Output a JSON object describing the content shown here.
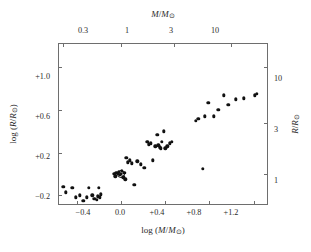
{
  "figure": {
    "kind": "scatter-plot"
  },
  "axes": {
    "bottom": {
      "title_prefix": "log (",
      "title_m": "M",
      "title_slash": "/",
      "title_m2": "M",
      "title_sun": "⊙",
      "title_suffix": ")",
      "ticks": [
        "−0.4",
        "0.0",
        "+0.4",
        "+0.8",
        "+1.2"
      ],
      "tick_values": [
        -0.4,
        0.0,
        0.4,
        0.8,
        1.2
      ]
    },
    "top": {
      "title_m": "M",
      "title_slash": "/",
      "title_m2": "M",
      "title_sun": "⊙",
      "ticks": [
        "0.3",
        "1",
        "3",
        "10"
      ],
      "tick_values": [
        0.3,
        1,
        3,
        10
      ]
    },
    "left": {
      "title_prefix": "log (",
      "title_r": "R",
      "title_slash": "/",
      "title_r2": "R",
      "title_sun": "⊙",
      "title_suffix": ")",
      "ticks": [
        "+1.0",
        "+0.6",
        "+0.2",
        "−0.2"
      ],
      "tick_values": [
        1.0,
        0.6,
        0.2,
        -0.2
      ]
    },
    "right": {
      "title_r": "R",
      "title_slash": "/",
      "title_r2": "R",
      "title_sun": "⊙",
      "ticks": [
        "10",
        "3",
        "1"
      ],
      "tick_values": [
        10,
        3,
        1
      ]
    }
  },
  "chart_data": {
    "type": "scatter",
    "title": "",
    "xlabel": "log (M/M⊙)",
    "ylabel": "log (R/R⊙)",
    "xlabel_top": "M/M⊙",
    "ylabel_right": "R/R⊙",
    "xlim": [
      -0.56,
      1.34
    ],
    "ylim": [
      -0.3,
      1.22
    ],
    "xticks": [
      -0.4,
      0.0,
      0.4,
      0.8,
      1.2
    ],
    "xticklabels": [
      "−0.4",
      "0.0",
      "+0.4",
      "+0.8",
      "+1.2"
    ],
    "yticks": [
      1.0,
      0.6,
      0.2,
      -0.2
    ],
    "yticklabels": [
      "+1.0",
      "+0.6",
      "+0.2",
      "−0.2"
    ],
    "xticks_top_linear": [
      0.3,
      1,
      3,
      10
    ],
    "yticks_right_linear": [
      10,
      3,
      1
    ],
    "grid": false,
    "legend": null,
    "marker": "filled-circle",
    "marker_color": "#111111",
    "series": [
      {
        "name": "stars",
        "x": [
          -0.52,
          -0.5,
          -0.44,
          -0.41,
          -0.37,
          -0.34,
          -0.31,
          -0.29,
          -0.26,
          -0.24,
          -0.22,
          -0.21,
          -0.2,
          -0.19,
          -0.18,
          -0.06,
          -0.05,
          -0.04,
          -0.03,
          -0.02,
          -0.01,
          0.0,
          0.01,
          0.02,
          0.03,
          0.04,
          0.05,
          0.06,
          0.08,
          0.1,
          0.12,
          0.15,
          0.18,
          0.21,
          0.24,
          0.25,
          0.27,
          0.29,
          0.31,
          0.33,
          0.34,
          0.35,
          0.36,
          0.37,
          0.39,
          0.4,
          0.42,
          0.44,
          0.46,
          0.68,
          0.7,
          0.74,
          0.76,
          0.79,
          0.84,
          0.88,
          0.93,
          0.97,
          1.04,
          1.11,
          1.21,
          1.23
        ],
        "y": [
          -0.12,
          -0.17,
          -0.13,
          -0.22,
          -0.2,
          -0.25,
          -0.22,
          -0.13,
          -0.2,
          -0.23,
          -0.24,
          -0.21,
          -0.13,
          -0.22,
          -0.19,
          0.0,
          -0.02,
          0.01,
          0.0,
          0.02,
          -0.01,
          0.0,
          0.03,
          -0.03,
          0.01,
          -0.05,
          0.15,
          0.11,
          0.13,
          0.1,
          -0.1,
          0.12,
          0.09,
          0.06,
          0.3,
          0.28,
          0.29,
          0.13,
          0.26,
          0.37,
          0.27,
          0.25,
          0.24,
          0.3,
          0.4,
          0.24,
          0.26,
          0.29,
          0.3,
          0.5,
          0.52,
          0.05,
          0.54,
          0.67,
          0.54,
          0.6,
          0.74,
          0.65,
          0.7,
          0.71,
          0.74,
          0.75
        ]
      }
    ],
    "special_marker": {
      "name": "sun",
      "symbol": "⊙",
      "x": 0.0,
      "y": 0.0
    },
    "n_points": 62
  }
}
